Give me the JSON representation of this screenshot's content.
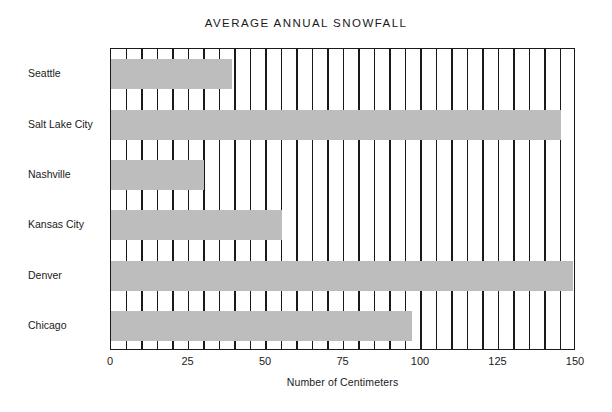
{
  "chart_data": {
    "type": "bar",
    "orientation": "horizontal",
    "title": "AVERAGE ANNUAL SNOWFALL",
    "xlabel": "Number of Centimeters",
    "ylabel": "",
    "categories": [
      "Seattle",
      "Salt Lake City",
      "Nashville",
      "Kansas City",
      "Denver",
      "Chicago"
    ],
    "values": [
      39,
      145,
      30,
      55,
      149,
      97
    ],
    "xlim": [
      0,
      150
    ],
    "xticks": [
      0,
      25,
      50,
      75,
      100,
      125,
      150
    ],
    "xtick_labels": [
      "0",
      "25",
      "50",
      "75",
      "100",
      "125",
      "150"
    ],
    "grid": "vertical-every-5-units",
    "gridline_step": 5,
    "legend": "none",
    "bar_color": "#bdbdbd",
    "axis_color": "#1a1a1a",
    "background_color": "#ffffff"
  }
}
